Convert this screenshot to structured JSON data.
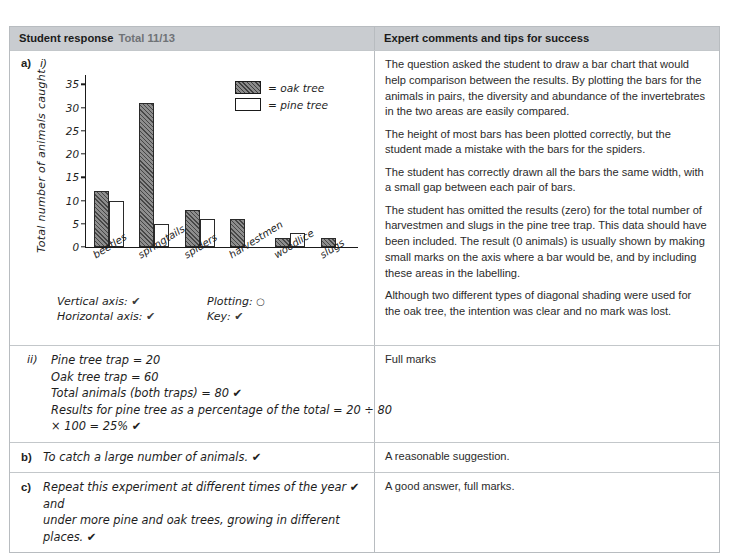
{
  "header": {
    "left_title": "Student response",
    "total": "Total 11/13",
    "right_title": "Expert comments and tips for success"
  },
  "part_a": {
    "label": "a)",
    "roman": "i)",
    "legend": [
      {
        "key": "oak-tree-swatch",
        "text": "= oak tree"
      },
      {
        "key": "pine-tree-swatch",
        "text": "= pine tree"
      }
    ],
    "marks": {
      "vertical_axis": "Vertical axis:",
      "vertical_axis_mark": "✔",
      "plotting": "Plotting:",
      "plotting_mark": "○",
      "horizontal_axis": "Horizontal axis:",
      "horizontal_axis_mark": "✔",
      "key": "Key:",
      "key_mark": "✔"
    },
    "expert_comments": [
      "The question asked the student to draw a bar chart that would help comparison between the results. By plotting the bars for the animals in pairs, the diversity and abundance of the invertebrates in the two areas are easily compared.",
      "The height of most bars has been plotted correctly, but the student made a mistake with the bars for the spiders.",
      "The student has correctly drawn all the bars the same width, with a small gap between each pair of bars.",
      "The student has omitted the results (zero) for the total number of harvestmen and slugs in the pine tree trap. This data should have been included. The result (0 animals) is usually shown by making small marks on the axis where a bar would be, and by including these areas in the labelling.",
      "Although two different types of diagonal shading were used for the oak tree, the intention was clear and no mark was lost."
    ]
  },
  "part_a_ii": {
    "roman": "ii)",
    "lines": [
      "Pine tree trap = 20",
      "Oak tree trap = 60",
      "Total animals (both traps) = 80 ✔",
      "Results for pine tree as a percentage of the total = 20 ÷ 80",
      "× 100 = 25% ✔"
    ],
    "expert_comment": "Full marks"
  },
  "part_b": {
    "label": "b)",
    "answer": "To catch a large number of animals. ✔",
    "expert_comment": "A reasonable suggestion."
  },
  "part_c": {
    "label": "c)",
    "answer_line1": "Repeat this experiment at different times of the year ✔ and",
    "answer_line2": "under more pine and oak trees, growing in different places. ✔",
    "expert_comment": "A good answer, full marks."
  },
  "chart_data": {
    "type": "bar",
    "title": "",
    "xlabel": "",
    "ylabel": "Total number of animals caught",
    "categories": [
      "beetles",
      "springtails",
      "spiders",
      "harvestmen",
      "woodlice",
      "slugs"
    ],
    "series": [
      {
        "name": "oak tree",
        "values": [
          12,
          31,
          8,
          6,
          2,
          2
        ]
      },
      {
        "name": "pine tree",
        "values": [
          10,
          5,
          6,
          0,
          3,
          0
        ]
      }
    ],
    "ylim": [
      0,
      37
    ],
    "yticks": [
      0,
      5,
      10,
      15,
      20,
      25,
      30,
      35
    ],
    "grid": false,
    "legend_position": "top-right"
  }
}
